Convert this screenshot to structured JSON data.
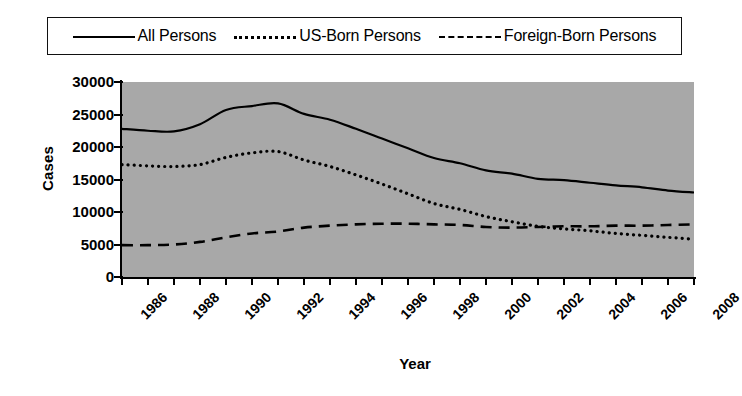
{
  "chart_data": {
    "type": "line",
    "title": "",
    "xlabel": "Year",
    "ylabel": "Cases",
    "xlim": [
      1986,
      2008
    ],
    "ylim": [
      0,
      30000
    ],
    "ytick_labels": [
      "30000",
      "25000",
      "20000",
      "15000",
      "10000",
      "5000",
      "0"
    ],
    "ytick_values": [
      30000,
      25000,
      20000,
      15000,
      10000,
      5000,
      0
    ],
    "xtick_values": [
      1986,
      1987,
      1988,
      1989,
      1990,
      1991,
      1992,
      1993,
      1994,
      1995,
      1996,
      1997,
      1998,
      1999,
      2000,
      2001,
      2002,
      2003,
      2004,
      2005,
      2006,
      2007,
      2008
    ],
    "xtick_labels": [
      "1986",
      "",
      "1988",
      "",
      "1990",
      "",
      "1992",
      "",
      "1994",
      "",
      "1996",
      "",
      "1998",
      "",
      "2000",
      "",
      "2002",
      "",
      "2004",
      "",
      "2006",
      "",
      "2008"
    ],
    "grid": false,
    "legend_position": "top",
    "plot_background": "#a8a8a8",
    "line_color": "#000000",
    "x": [
      1986,
      1987,
      1988,
      1989,
      1990,
      1991,
      1992,
      1993,
      1994,
      1995,
      1996,
      1997,
      1998,
      1999,
      2000,
      2001,
      2002,
      2003,
      2004,
      2005,
      2006,
      2007,
      2008
    ],
    "series": [
      {
        "name": "All Persons",
        "style": "solid",
        "values": [
          22800,
          22500,
          22400,
          23500,
          25700,
          26300,
          26700,
          25100,
          24200,
          22800,
          21300,
          19800,
          18300,
          17500,
          16400,
          15900,
          15100,
          14900,
          14500,
          14100,
          13800,
          13300,
          13000
        ]
      },
      {
        "name": "US-Born Persons",
        "style": "dotted",
        "values": [
          17300,
          17100,
          17000,
          17300,
          18400,
          19100,
          19300,
          18000,
          17000,
          15700,
          14300,
          12800,
          11300,
          10400,
          9300,
          8500,
          7800,
          7400,
          7100,
          6700,
          6400,
          6100,
          5800
        ]
      },
      {
        "name": "Foreign-Born Persons",
        "style": "dashed",
        "values": [
          4900,
          4900,
          5000,
          5400,
          6100,
          6700,
          7000,
          7600,
          7900,
          8100,
          8200,
          8200,
          8100,
          8000,
          7700,
          7600,
          7700,
          7800,
          7800,
          7900,
          7900,
          8000,
          8100
        ]
      }
    ]
  },
  "legend": {
    "entries": [
      {
        "label": "All Persons",
        "style": "solid"
      },
      {
        "label": "US-Born Persons",
        "style": "dotted"
      },
      {
        "label": "Foreign-Born Persons",
        "style": "dashed"
      }
    ]
  },
  "axes": {
    "y_title": "Cases",
    "x_title": "Year"
  }
}
